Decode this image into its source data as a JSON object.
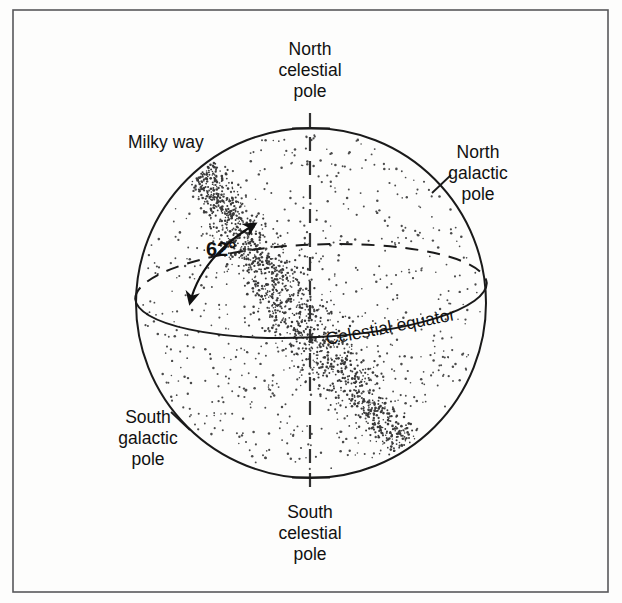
{
  "figure": {
    "kind": "celestial-sphere-diagram",
    "background_color": "#fdfdfc",
    "ink_color": "#111111",
    "frame_color": "#58585a"
  },
  "labels": {
    "north_celestial_pole": {
      "lines": [
        "North",
        "celestial",
        "pole"
      ],
      "x": 310,
      "y": 55
    },
    "south_celestial_pole": {
      "lines": [
        "South",
        "celestial",
        "pole"
      ],
      "x": 310,
      "y": 518
    },
    "north_galactic_pole": {
      "lines": [
        "North",
        "galactic",
        "pole"
      ],
      "x": 478,
      "y": 158
    },
    "south_galactic_pole": {
      "lines": [
        "South",
        "galactic",
        "pole"
      ],
      "x": 148,
      "y": 423
    },
    "milky_way": {
      "text": "Milky way",
      "x": 128,
      "y": 148
    },
    "celestial_equator": {
      "text": "Celestial equator",
      "x": 327,
      "y": 345,
      "rotation_deg": -11
    },
    "tilt_angle": {
      "text": "62°",
      "value": 62,
      "unit": "degrees",
      "x": 206,
      "y": 256
    }
  },
  "geometry": {
    "frame": {
      "x": 13,
      "y": 10,
      "width": 595,
      "height": 582
    },
    "sphere": {
      "cx": 311,
      "cy": 303,
      "r": 175
    },
    "equator_ellipse": {
      "cx": 311,
      "cy": 291,
      "rx": 176,
      "ry": 47,
      "tilt_deg": -2.6
    },
    "polar_axis": {
      "x": 310,
      "y1": 113,
      "y2": 497
    },
    "galactic_pole_ticks": [
      {
        "name": "north-galactic-pole-tick",
        "x": 441,
        "y": 184
      },
      {
        "name": "south-galactic-pole-tick",
        "x": 180,
        "y": 421
      }
    ],
    "angle_arc": {
      "start": [
        255,
        222
      ],
      "end": [
        188,
        306
      ],
      "control": [
        200,
        262
      ],
      "arrowheads": "both"
    },
    "milky_way_band": {
      "description": "Star-dense band crossing the sphere from upper-left to lower-right, inclined 62 degrees to the celestial equator",
      "inclination_deg": 62,
      "start": [
        200,
        160
      ],
      "end": [
        425,
        465
      ]
    }
  }
}
